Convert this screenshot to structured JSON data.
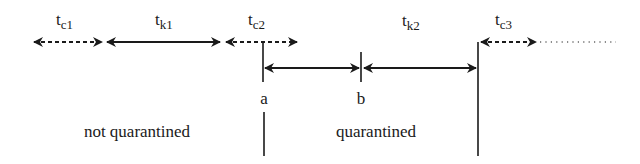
{
  "diagram": {
    "colors": {
      "ink": "#1a1a1a",
      "background": "#ffffff"
    },
    "interval_labels": [
      {
        "id": "tc1",
        "base": "t",
        "sub": "c1",
        "style": "dashed"
      },
      {
        "id": "tk1",
        "base": "t",
        "sub": "k1",
        "style": "solid"
      },
      {
        "id": "tc2",
        "base": "t",
        "sub": "c2",
        "style": "dashed"
      },
      {
        "id": "tk2",
        "base": "t",
        "sub": "k2",
        "style": "solid"
      },
      {
        "id": "tc3",
        "base": "t",
        "sub": "c3",
        "style": "dashed-then-dotted"
      }
    ],
    "points": [
      {
        "id": "a",
        "label": "a"
      },
      {
        "id": "b",
        "label": "b"
      }
    ],
    "regions": [
      {
        "id": "not-quarantined",
        "label": "not quarantined"
      },
      {
        "id": "quarantined",
        "label": "quarantined"
      }
    ]
  }
}
